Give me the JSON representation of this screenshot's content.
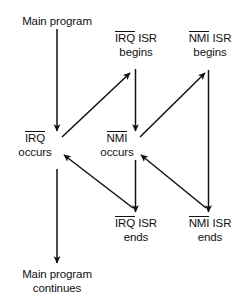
{
  "figure": {
    "background_color": "#ffffff",
    "stroke_color": "#111111",
    "text_color": "#111111"
  },
  "nodes": {
    "main_program": {
      "line1": "Main program"
    },
    "irq_isr_begins": {
      "overline": "IRQ",
      "rest": " ISR",
      "line2": "begins"
    },
    "nmi_isr_begins": {
      "overline": "NMI",
      "rest": " ISR",
      "line2": "begins"
    },
    "irq_occurs": {
      "overline": "IRQ",
      "line2": "occurs"
    },
    "nmi_occurs": {
      "overline": "NMI",
      "line2": "occurs"
    },
    "irq_isr_ends": {
      "overline": "IRQ",
      "rest": " ISR",
      "line2": "ends"
    },
    "nmi_isr_ends": {
      "overline": "NMI",
      "rest": " ISR",
      "line2": "ends"
    },
    "main_program_continues": {
      "line1": "Main program",
      "line2": "continues"
    }
  },
  "edges": [
    {
      "name": "main-program-to-irq-occurs",
      "from": "main_program",
      "to": "irq_occurs",
      "kind": "vertical-down"
    },
    {
      "name": "irq-occurs-to-irq-isr-begins",
      "from": "irq_occurs",
      "to": "irq_isr_begins",
      "kind": "diagonal-up-right"
    },
    {
      "name": "irq-isr-begins-to-nmi-occurs",
      "from": "irq_isr_begins",
      "to": "nmi_occurs",
      "kind": "vertical-down"
    },
    {
      "name": "nmi-occurs-to-nmi-isr-begins",
      "from": "nmi_occurs",
      "to": "nmi_isr_begins",
      "kind": "diagonal-up-right"
    },
    {
      "name": "nmi-isr-begins-to-nmi-isr-ends",
      "from": "nmi_isr_begins",
      "to": "nmi_isr_ends",
      "kind": "vertical-down"
    },
    {
      "name": "nmi-isr-ends-to-nmi-occurs",
      "from": "nmi_isr_ends",
      "to": "nmi_occurs",
      "kind": "diagonal-up-left"
    },
    {
      "name": "nmi-occurs-to-irq-isr-ends",
      "from": "nmi_occurs",
      "to": "irq_isr_ends",
      "kind": "vertical-down"
    },
    {
      "name": "irq-isr-ends-to-irq-occurs",
      "from": "irq_isr_ends",
      "to": "irq_occurs",
      "kind": "diagonal-up-left"
    },
    {
      "name": "irq-occurs-to-main-program-continues",
      "from": "irq_occurs",
      "to": "main_program_continues",
      "kind": "vertical-down"
    }
  ]
}
